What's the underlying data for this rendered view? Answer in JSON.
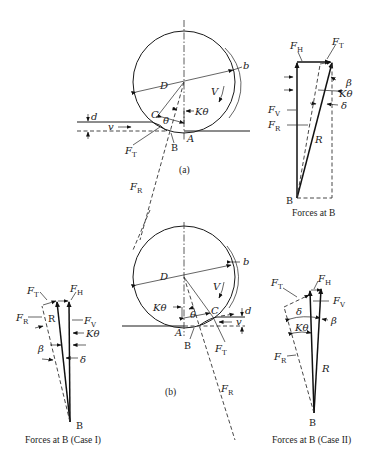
{
  "figure": {
    "panel_a": {
      "caption": "(a)",
      "labels": {
        "D": "D",
        "b": "b",
        "V": "V",
        "d": "d",
        "v": "v",
        "C": "C",
        "theta": "θ",
        "K_theta": "Kθ",
        "A": "A",
        "B": "B",
        "F_T": "F",
        "F_T_sub": "T",
        "F_R": "F",
        "F_R_sub": "R"
      }
    },
    "forces_a": {
      "caption": "Forces at B",
      "labels": {
        "F_H": "F",
        "F_H_sub": "H",
        "F_T": "F",
        "F_T_sub": "T",
        "F_V": "F",
        "F_V_sub": "V",
        "F_R": "F",
        "F_R_sub": "R",
        "R": "R",
        "beta": "β",
        "K_theta": "Kθ",
        "delta": "δ",
        "B": "B"
      }
    },
    "panel_b": {
      "caption": "(b)",
      "labels": {
        "D": "D",
        "b": "b",
        "V": "V",
        "d": "d",
        "v": "v",
        "C": "C",
        "theta": "θ",
        "K_theta": "Kθ",
        "A": "A",
        "B": "B",
        "F_T": "F",
        "F_T_sub": "T",
        "F_R": "F",
        "F_R_sub": "R"
      }
    },
    "forces_case1": {
      "caption": "Forces at B (Case I)",
      "labels": {
        "F_T": "F",
        "F_T_sub": "T",
        "F_H": "F",
        "F_H_sub": "H",
        "F_R": "F",
        "F_R_sub": "R",
        "R": "R",
        "F_V": "F",
        "F_V_sub": "V",
        "K_theta": "Kθ",
        "beta": "β",
        "delta": "δ",
        "B": "B"
      }
    },
    "forces_case2": {
      "caption": "Forces at B (Case II)",
      "labels": {
        "F_H": "F",
        "F_H_sub": "H",
        "F_T": "F",
        "F_T_sub": "T",
        "F_V": "F",
        "F_V_sub": "V",
        "delta": "δ",
        "beta": "β",
        "K_theta": "Kθ",
        "F_R": "F",
        "F_R_sub": "R",
        "R": "R",
        "B": "B"
      }
    }
  }
}
